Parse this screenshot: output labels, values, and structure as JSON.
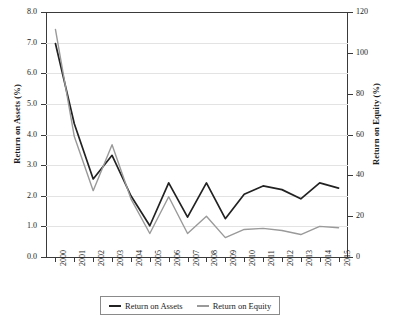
{
  "chart_data": {
    "type": "line",
    "title": "",
    "xlabel": "",
    "ylabel": "Return on Assets (%)",
    "ylabel_right": "Return on Equity (%)",
    "grid": true,
    "legend_position": "bottom",
    "categories": [
      "2000",
      "2001",
      "2002",
      "2003",
      "2004",
      "2005",
      "2006",
      "2007",
      "2008",
      "2009",
      "2010",
      "2011",
      "2012",
      "2013",
      "2014",
      "2015"
    ],
    "ylim": [
      0.0,
      8.0
    ],
    "yticks": [
      "0.0",
      "1.0",
      "2.0",
      "3.0",
      "4.0",
      "5.0",
      "6.0",
      "7.0",
      "8.0"
    ],
    "ytick_values": [
      0.0,
      1.0,
      2.0,
      3.0,
      4.0,
      5.0,
      6.0,
      7.0,
      8.0
    ],
    "ylim_right": [
      0,
      120
    ],
    "yticks_right": [
      "0",
      "20",
      "40",
      "60",
      "80",
      "100",
      "120"
    ],
    "ytick_values_right": [
      0,
      20,
      40,
      60,
      80,
      100,
      120
    ],
    "series": [
      {
        "name": "Return on Assets",
        "axis": "left",
        "color": "#222222",
        "values": [
          6.97,
          4.35,
          2.55,
          3.32,
          2.0,
          1.02,
          2.42,
          1.3,
          2.42,
          1.25,
          2.05,
          2.32,
          2.2,
          1.9,
          2.42,
          2.25
        ]
      },
      {
        "name": "Return on Equity",
        "axis": "right",
        "color": "#9a9a9a",
        "values": [
          111.5,
          59.0,
          32.5,
          55.0,
          28.5,
          11.5,
          29.5,
          11.5,
          20.0,
          9.5,
          13.5,
          14.0,
          13.0,
          11.0,
          15.0,
          14.3
        ]
      }
    ]
  },
  "legend": {
    "items": [
      {
        "label": "Return on Assets",
        "color": "#222222"
      },
      {
        "label": "Return on Equity",
        "color": "#9a9a9a"
      }
    ]
  }
}
